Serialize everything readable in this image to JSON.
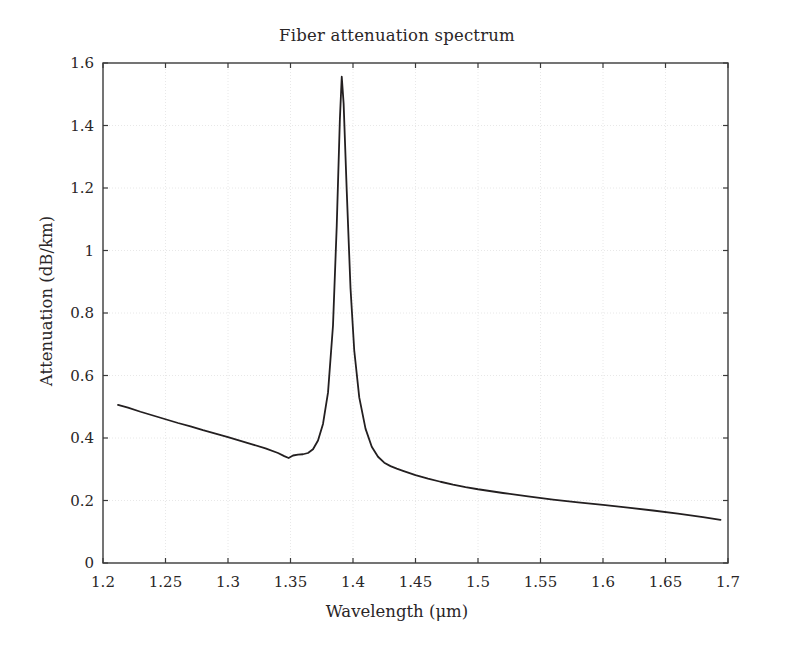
{
  "chart_data": {
    "type": "line",
    "title": "Fiber attenuation spectrum",
    "xlabel": "Wavelength (μm)",
    "ylabel": "Attenuation (dB/km)",
    "xlim": [
      1.2,
      1.7
    ],
    "ylim": [
      0,
      1.6
    ],
    "xticks": [
      1.2,
      1.25,
      1.3,
      1.35,
      1.4,
      1.45,
      1.5,
      1.55,
      1.6,
      1.65,
      1.7
    ],
    "xtick_labels": [
      "1.2",
      "1.25",
      "1.3",
      "1.35",
      "1.4",
      "1.45",
      "1.5",
      "1.55",
      "1.6",
      "1.65",
      "1.7"
    ],
    "yticks": [
      0,
      0.2,
      0.4,
      0.6,
      0.8,
      1,
      1.2,
      1.4,
      1.6
    ],
    "ytick_labels": [
      "0",
      "0.2",
      "0.4",
      "0.6",
      "0.8",
      "1",
      "1.2",
      "1.4",
      "1.6"
    ],
    "grid": true,
    "grid_style": "dotted",
    "grid_color": "#e8e8e8",
    "legend": null,
    "line_color": "#231f20",
    "line_width": 1.8,
    "series": [
      {
        "name": "Attenuation",
        "x": [
          1.212,
          1.22,
          1.23,
          1.24,
          1.25,
          1.26,
          1.27,
          1.28,
          1.29,
          1.3,
          1.31,
          1.32,
          1.33,
          1.34,
          1.345,
          1.3485,
          1.352,
          1.356,
          1.36,
          1.364,
          1.368,
          1.372,
          1.376,
          1.38,
          1.384,
          1.387,
          1.3895,
          1.391,
          1.3925,
          1.395,
          1.398,
          1.401,
          1.405,
          1.41,
          1.415,
          1.42,
          1.425,
          1.43,
          1.435,
          1.44,
          1.45,
          1.46,
          1.47,
          1.48,
          1.49,
          1.5,
          1.52,
          1.54,
          1.56,
          1.58,
          1.6,
          1.62,
          1.64,
          1.66,
          1.68,
          1.694
        ],
        "y": [
          0.506,
          0.497,
          0.484,
          0.472,
          0.46,
          0.448,
          0.437,
          0.425,
          0.414,
          0.403,
          0.391,
          0.379,
          0.367,
          0.352,
          0.342,
          0.336,
          0.344,
          0.347,
          0.348,
          0.352,
          0.364,
          0.392,
          0.445,
          0.545,
          0.76,
          1.08,
          1.42,
          1.556,
          1.47,
          1.19,
          0.88,
          0.68,
          0.53,
          0.43,
          0.372,
          0.34,
          0.321,
          0.31,
          0.302,
          0.295,
          0.281,
          0.27,
          0.26,
          0.251,
          0.243,
          0.236,
          0.224,
          0.213,
          0.203,
          0.194,
          0.186,
          0.177,
          0.168,
          0.158,
          0.147,
          0.138
        ]
      }
    ],
    "peak": {
      "x": 1.391,
      "y": 1.556,
      "label": "water absorption peak"
    },
    "minimum_left": {
      "x": 1.3485,
      "y": 0.336
    }
  },
  "figure": {
    "background_color": "#ffffff",
    "axes_color": "#3a3a3a"
  }
}
